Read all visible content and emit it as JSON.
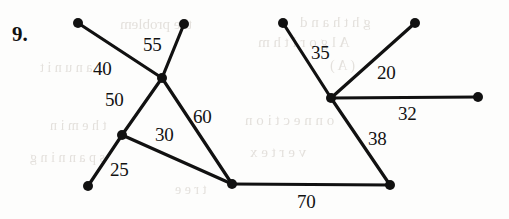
{
  "figure": {
    "item_number": "9.",
    "background_color": "#fdfdfc",
    "ink_color": "#111111",
    "node_radius": 5,
    "edge_width": 3.2
  },
  "graph_data": {
    "type": "node-link-diagram",
    "description": "Weighted undirected graph drawn as two linked clusters with numeric edge weights",
    "nodes": [
      {
        "id": "a",
        "x": 78,
        "y": 23
      },
      {
        "id": "b",
        "x": 184,
        "y": 24
      },
      {
        "id": "c",
        "x": 162,
        "y": 78
      },
      {
        "id": "d",
        "x": 122,
        "y": 135
      },
      {
        "id": "e",
        "x": 88,
        "y": 186
      },
      {
        "id": "f",
        "x": 232,
        "y": 184
      },
      {
        "id": "g",
        "x": 283,
        "y": 23
      },
      {
        "id": "h",
        "x": 415,
        "y": 23
      },
      {
        "id": "i",
        "x": 331,
        "y": 98
      },
      {
        "id": "j",
        "x": 478,
        "y": 97
      },
      {
        "id": "k",
        "x": 390,
        "y": 185
      }
    ],
    "edges": [
      {
        "from": "a",
        "to": "c",
        "weight": 40,
        "label_x": 93,
        "label_y": 58
      },
      {
        "from": "b",
        "to": "c",
        "weight": 55,
        "label_x": 143,
        "label_y": 34
      },
      {
        "from": "c",
        "to": "d",
        "weight": 50,
        "label_x": 105,
        "label_y": 89
      },
      {
        "from": "c",
        "to": "f",
        "weight": 60,
        "label_x": 193,
        "label_y": 106
      },
      {
        "from": "d",
        "to": "f",
        "weight": 30,
        "label_x": 155,
        "label_y": 124
      },
      {
        "from": "d",
        "to": "e",
        "weight": 25,
        "label_x": 110,
        "label_y": 159
      },
      {
        "from": "f",
        "to": "k",
        "weight": 70,
        "label_x": 297,
        "label_y": 191
      },
      {
        "from": "g",
        "to": "i",
        "weight": 35,
        "label_x": 311,
        "label_y": 42
      },
      {
        "from": "h",
        "to": "i",
        "weight": 20,
        "label_x": 377,
        "label_y": 62
      },
      {
        "from": "i",
        "to": "j",
        "weight": 32,
        "label_x": 398,
        "label_y": 103
      },
      {
        "from": "i",
        "to": "k",
        "weight": 38,
        "label_x": 368,
        "label_y": 128
      }
    ],
    "labels": [
      "40",
      "55",
      "50",
      "60",
      "30",
      "25",
      "70",
      "35",
      "20",
      "32",
      "38"
    ]
  },
  "ghost_text": [
    {
      "text": "the problem",
      "x": 120,
      "y": 16,
      "size": 15
    },
    {
      "text": "g h t   h a n d",
      "x": 300,
      "y": 14,
      "size": 15
    },
    {
      "text": "a n   u n i t",
      "x": 40,
      "y": 60,
      "size": 14
    },
    {
      "text": "A l g o r i t h m",
      "x": 258,
      "y": 34,
      "size": 15
    },
    {
      "text": "( A )",
      "x": 330,
      "y": 58,
      "size": 14
    },
    {
      "text": "t h e   m i n",
      "x": 50,
      "y": 118,
      "size": 14
    },
    {
      "text": "o n n e c t i o n",
      "x": 245,
      "y": 112,
      "size": 15
    },
    {
      "text": "s p a n n i n g",
      "x": 30,
      "y": 150,
      "size": 14
    },
    {
      "text": "v e r t e x",
      "x": 250,
      "y": 144,
      "size": 15
    },
    {
      "text": "t r e e",
      "x": 175,
      "y": 182,
      "size": 14
    }
  ]
}
